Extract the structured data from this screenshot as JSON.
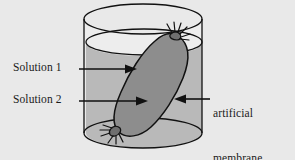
{
  "diagram": {
    "background_color": "#e9e9e9",
    "labels": {
      "solution_1": "Solution 1",
      "solution_2": "Solution 2",
      "membrane_line_1": "artificial",
      "membrane_line_2": "membrane",
      "membrane_line_3": "of model",
      "membrane_line_4": "cell"
    },
    "parts": {
      "beaker": "beaker",
      "water": "water",
      "water_line": "water-surface",
      "membrane_bag": "artificial-membrane-bag",
      "top_knot": "top-tie-knot",
      "bottom_knot": "bottom-tie-knot"
    },
    "colors": {
      "outline": "#111111",
      "bag_fill": "#8d8d8d",
      "water_fill": "#b9b9b9",
      "beaker_air": "#ededed",
      "page_background": "#e9e9e9",
      "text": "#1a1a1a"
    }
  }
}
